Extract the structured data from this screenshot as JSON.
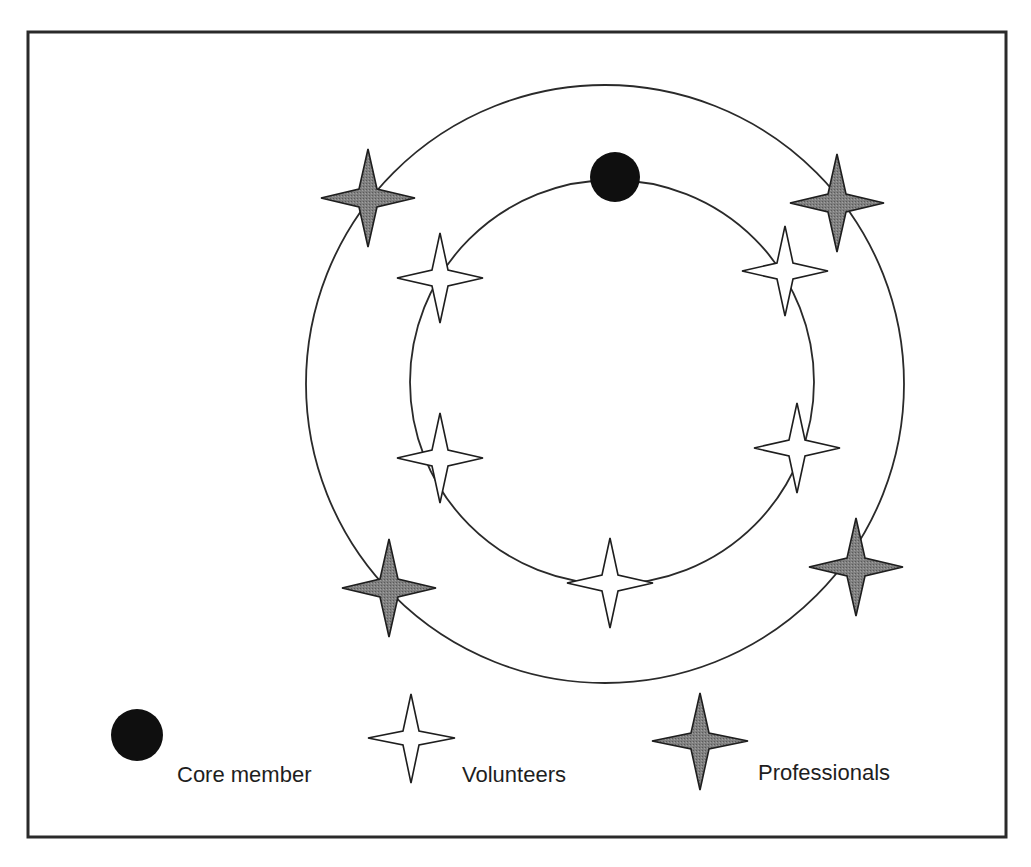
{
  "colors": {
    "frame": "#2a2a2a",
    "circle_stroke": "#2a2a2a",
    "core_fill": "#0f0f0f",
    "volunteer_fill": "#ffffff",
    "professional_fill": "#7a7a7a",
    "star_stroke": "#1e1e1e",
    "text": "#1e1e1e"
  },
  "diagram": {
    "outer_circle": {
      "cx": 605,
      "cy": 384,
      "r": 299
    },
    "inner_circle": {
      "cx": 612,
      "cy": 382,
      "r": 202
    },
    "core_members": [
      {
        "cx": 615,
        "cy": 177,
        "r": 25
      }
    ],
    "volunteers": [
      {
        "cx": 440,
        "cy": 278
      },
      {
        "cx": 785,
        "cy": 271
      },
      {
        "cx": 440,
        "cy": 458
      },
      {
        "cx": 797,
        "cy": 448
      },
      {
        "cx": 610,
        "cy": 583
      }
    ],
    "professionals": [
      {
        "cx": 368,
        "cy": 198
      },
      {
        "cx": 837,
        "cy": 203
      },
      {
        "cx": 389,
        "cy": 588
      },
      {
        "cx": 856,
        "cy": 567
      }
    ]
  },
  "legend": {
    "core_member": {
      "label": "Core member",
      "icon": "filled-black-circle"
    },
    "volunteers": {
      "label": "Volunteers",
      "icon": "white-four-point-star"
    },
    "professionals": {
      "label": "Professionals",
      "icon": "gray-four-point-star"
    }
  }
}
